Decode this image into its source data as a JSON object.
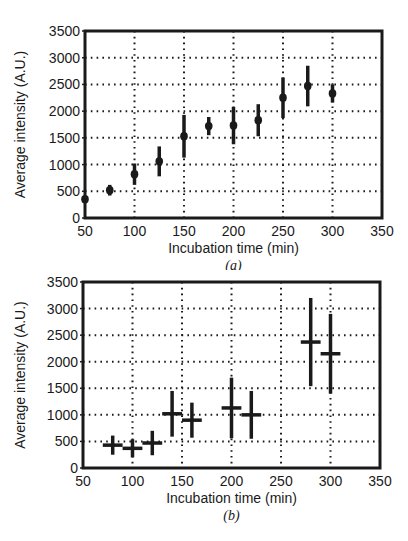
{
  "chart_data": [
    {
      "type": "scatter",
      "panel_label": "(a)",
      "title": "",
      "xlabel": "Incubation time (min)",
      "ylabel": "Average intensity (A.U.)",
      "xlim": [
        50,
        350
      ],
      "ylim": [
        0,
        3500
      ],
      "xticks": [
        50,
        100,
        150,
        200,
        250,
        300,
        350
      ],
      "yticks": [
        0,
        500,
        1000,
        1500,
        2000,
        2500,
        3000,
        3500
      ],
      "grid": true,
      "grid_style": "dotted",
      "error_bars": "vertical",
      "series": [
        {
          "name": "Average intensity",
          "x": [
            50,
            75,
            100,
            125,
            150,
            175,
            200,
            225,
            250,
            275,
            300
          ],
          "y": [
            350,
            520,
            820,
            1060,
            1530,
            1720,
            1730,
            1830,
            2250,
            2470,
            2330
          ],
          "yerr": [
            0,
            100,
            200,
            280,
            400,
            170,
            350,
            300,
            380,
            380,
            170
          ]
        }
      ]
    },
    {
      "type": "scatter",
      "panel_label": "(b)",
      "title": "",
      "xlabel": "Incubation time (min)",
      "ylabel": "Average intensity (A.U.)",
      "xlim": [
        50,
        350
      ],
      "ylim": [
        0,
        3500
      ],
      "xticks": [
        50,
        100,
        150,
        200,
        250,
        300,
        350
      ],
      "yticks": [
        0,
        500,
        1000,
        1500,
        2000,
        2500,
        3000,
        3500
      ],
      "grid": true,
      "grid_style": "dotted",
      "error_bars": "both",
      "series": [
        {
          "name": "Average intensity",
          "x": [
            80,
            100,
            120,
            140,
            160,
            200,
            220,
            280,
            300
          ],
          "y": [
            430,
            370,
            470,
            1020,
            900,
            1130,
            1000,
            2370,
            2150
          ],
          "yerr": [
            180,
            170,
            230,
            430,
            330,
            570,
            450,
            830,
            750
          ],
          "xerr": [
            10,
            10,
            10,
            10,
            10,
            10,
            10,
            10,
            10
          ]
        }
      ]
    }
  ],
  "panels": {
    "a": {
      "xlabel": "Incubation time (min)",
      "ylabel": "Average intensity (A.U.)",
      "caption": "(a)"
    },
    "b": {
      "xlabel": "Incubation time (min)",
      "ylabel": "Average intensity (A.U.)",
      "caption": "(b)"
    }
  },
  "colors": {
    "ink": "#1a1a1a",
    "background": "#ffffff"
  }
}
